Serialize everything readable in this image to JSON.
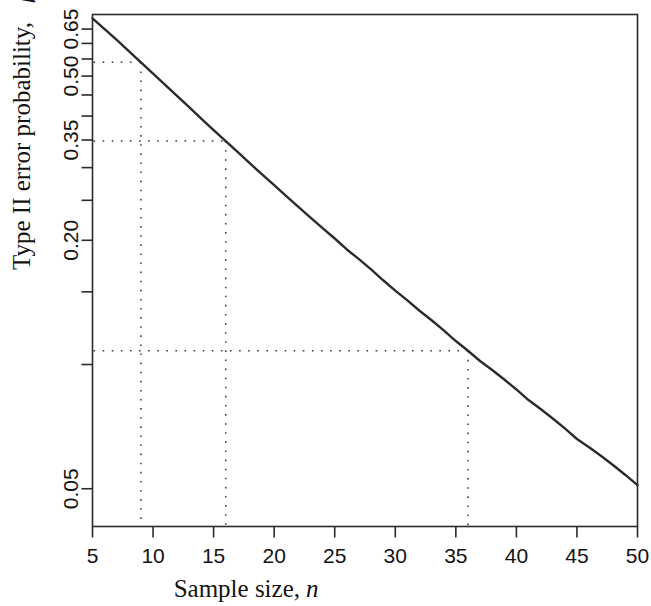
{
  "figure": {
    "background_color": "#ffffff",
    "line_color": "#2b2b2b",
    "guide_color": "#3a3a3a"
  },
  "chart_data": {
    "type": "line",
    "title": "",
    "subtitle": "",
    "xlabel": "Sample size, n",
    "xlabel_text": "Sample size,",
    "xlabel_var": "n",
    "ylabel": "Type II error probability, β",
    "ylabel_text": "Type II error probability,",
    "ylabel_var": "β",
    "xlim": [
      5,
      50
    ],
    "ylim": [
      0.04,
      0.7
    ],
    "xticks": [
      5,
      10,
      15,
      20,
      25,
      30,
      35,
      40,
      45,
      50
    ],
    "xtick_labels": [
      "5",
      "10",
      "15",
      "20",
      "25",
      "30",
      "35",
      "40",
      "45",
      "50"
    ],
    "yticks": [
      0.05,
      0.1,
      0.15,
      0.2,
      0.25,
      0.3,
      0.35,
      0.4,
      0.45,
      0.5,
      0.55,
      0.6,
      0.65
    ],
    "ytick_labels_shown": [
      "0.65",
      "0.50",
      "0.35",
      "0.20",
      "0.05"
    ],
    "ytick_labeled_values": [
      0.65,
      0.5,
      0.35,
      0.2,
      0.05
    ],
    "y_scale": "log",
    "grid": false,
    "legend": null,
    "legend_position": "none",
    "series": [
      {
        "name": "Type II error probability",
        "x": [
          5,
          6,
          7,
          8,
          9,
          10,
          11,
          12,
          13,
          14,
          15,
          16,
          17,
          18,
          19,
          20,
          21,
          22,
          23,
          24,
          25,
          26,
          27,
          28,
          29,
          30,
          31,
          32,
          33,
          34,
          35,
          36,
          37,
          38,
          39,
          40,
          41,
          42,
          43,
          44,
          45,
          46,
          47,
          48,
          49,
          50
        ],
        "y": [
          0.69,
          0.65,
          0.612,
          0.575,
          0.54,
          0.507,
          0.476,
          0.447,
          0.42,
          0.394,
          0.37,
          0.348,
          0.327,
          0.307,
          0.289,
          0.272,
          0.256,
          0.241,
          0.227,
          0.214,
          0.202,
          0.19,
          0.18,
          0.17,
          0.16,
          0.151,
          0.143,
          0.135,
          0.128,
          0.121,
          0.114,
          0.108,
          0.102,
          0.097,
          0.092,
          0.087,
          0.082,
          0.078,
          0.074,
          0.07,
          0.066,
          0.063,
          0.06,
          0.057,
          0.054,
          0.051
        ]
      }
    ],
    "annotations": [
      {
        "kind": "reference-point",
        "x": 9,
        "y": 0.54,
        "style": "dotted"
      },
      {
        "kind": "reference-point",
        "x": 16,
        "y": 0.348,
        "style": "dotted"
      },
      {
        "kind": "reference-point",
        "x": 36,
        "y": 0.108,
        "style": "dotted"
      }
    ]
  }
}
